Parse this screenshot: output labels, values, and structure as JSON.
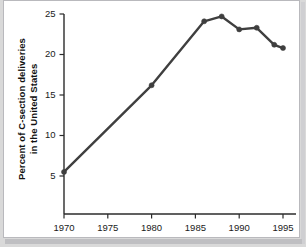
{
  "figure": {
    "background_color": "#ffffff",
    "frame_color": "#b9b9bd",
    "shadow_color": "#bfbfc2",
    "ink_color": "#3f3f3f"
  },
  "axis": {
    "y_title_line1": "Percent of C-section deliveries",
    "y_title_line2": "in the United States",
    "y_ticks": [
      "5",
      "10",
      "15",
      "20",
      "25"
    ],
    "x_ticks": [
      "1970",
      "1975",
      "1980",
      "1985",
      "1990",
      "1995"
    ]
  },
  "chart_data": {
    "type": "line",
    "title": "",
    "subtitle": "",
    "xlabel": "",
    "ylabel": "Percent of C-section deliveries in the United States",
    "xlim": [
      1968,
      1996
    ],
    "ylim": [
      2.5,
      26.5
    ],
    "xticks": [
      1970,
      1975,
      1980,
      1985,
      1990,
      1995
    ],
    "yticks": [
      5,
      10,
      15,
      20,
      25
    ],
    "grid": false,
    "legend": null,
    "marker": "circle",
    "line_color": "#3f3f3f",
    "x": [
      1970,
      1980,
      1986,
      1988,
      1990,
      1992,
      1994,
      1995
    ],
    "y": [
      5.5,
      16.2,
      24.1,
      24.7,
      23.1,
      23.3,
      21.2,
      20.8
    ],
    "series": [
      {
        "name": "Percent of C-section deliveries in the United States",
        "points": [
          {
            "x": 1970,
            "y": 5.5
          },
          {
            "x": 1980,
            "y": 16.2
          },
          {
            "x": 1986,
            "y": 24.1
          },
          {
            "x": 1988,
            "y": 24.7
          },
          {
            "x": 1990,
            "y": 23.1
          },
          {
            "x": 1992,
            "y": 23.3
          },
          {
            "x": 1994,
            "y": 21.2
          },
          {
            "x": 1995,
            "y": 20.8
          }
        ]
      }
    ]
  }
}
